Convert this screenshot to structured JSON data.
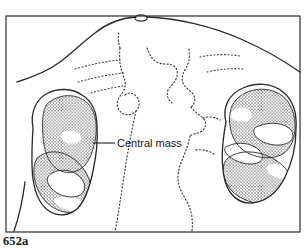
{
  "figure": {
    "kind": "medical-line-drawing",
    "label_top_left": "651a",
    "label_bottom_left": "652a",
    "background_color": "#ffffff",
    "ink_color": "#1a1a1a",
    "frame": {
      "stroke_color": "#2b2b2b",
      "stroke_width": 1.2,
      "x": 6,
      "y": 16,
      "width": 294,
      "height": 216
    }
  },
  "annotations": [
    {
      "id": "central-mass",
      "text": "Central mass",
      "text_x": 117,
      "text_y": 147,
      "leader_from_x": 93,
      "leader_from_y": 143,
      "leader_to_x": 115,
      "leader_to_y": 143,
      "points_to": "left-kidney-mass"
    }
  ],
  "structures": {
    "body_outline": {
      "name": "torso and shoulder soft-tissue outline",
      "stroke_color": "#2b2b2b",
      "stroke_width": 1.3,
      "style": "solid"
    },
    "spine_outline": {
      "name": "vertebral column and psoas margins",
      "stroke_color": "#3a3a3a",
      "stroke_width": 1.1,
      "style": "dotted"
    },
    "ribs": {
      "name": "lower rib shadows",
      "stroke_color": "#3a3a3a",
      "stroke_width": 1.0,
      "style": "dotted"
    },
    "left_kidney": {
      "name": "left kidney outline (patient right on image left)",
      "stroke_color": "#2b2b2b",
      "stroke_width": 1.3,
      "fill": "none",
      "mass_fill": "stipple"
    },
    "right_kidney": {
      "name": "right kidney outline (patient left on image right)",
      "stroke_color": "#2b2b2b",
      "stroke_width": 1.3,
      "fill": "none",
      "mass_fill": "stipple"
    },
    "neck_notch": {
      "name": "midline notch at superior frame margin",
      "cx": 141,
      "cy": 18,
      "rx": 6,
      "ry": 3
    }
  },
  "stipple": {
    "description": "fine regular dot grid indicating tumour mass density",
    "dot_color": "#1e1e1e",
    "dot_radius": 0.62,
    "spacing_x": 3.1,
    "spacing_y": 3.1
  }
}
